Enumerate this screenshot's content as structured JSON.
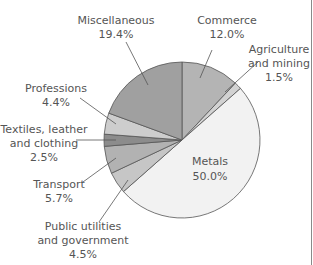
{
  "chart_data": {
    "type": "pie",
    "title": "",
    "start_angle_deg": 0,
    "direction": "clockwise",
    "slices": [
      {
        "label": "Commerce",
        "value": 12.0,
        "display": "12.0%",
        "color": "#b4b4b4"
      },
      {
        "label": "Agriculture and mining",
        "value": 1.5,
        "display": "1.5%",
        "color": "#d2d2d2"
      },
      {
        "label": "Metals",
        "value": 50.0,
        "display": "50.0%",
        "color": "#f2f2f2"
      },
      {
        "label": "Public utilities and government",
        "value": 4.5,
        "display": "4.5%",
        "color": "#c6c6c6"
      },
      {
        "label": "Transport",
        "value": 5.7,
        "display": "5.7%",
        "color": "#b2b2b2"
      },
      {
        "label": "Textiles, leather and clothing",
        "value": 2.5,
        "display": "2.5%",
        "color": "#8c8c8c"
      },
      {
        "label": "Professions",
        "value": 4.4,
        "display": "4.4%",
        "color": "#cdcdcd"
      },
      {
        "label": "Miscellaneous",
        "value": 19.4,
        "display": "19.4%",
        "color": "#a0a0a0"
      }
    ]
  },
  "labels": {
    "miscellaneous": {
      "line1": "Miscellaneous",
      "line2": "19.4%"
    },
    "commerce": {
      "line1": "Commerce",
      "line2": "12.0%"
    },
    "agriculture": {
      "line1": "Agriculture",
      "line2": "and mining",
      "line3": "1.5%"
    },
    "professions": {
      "line1": "Professions",
      "line2": "4.4%"
    },
    "textiles": {
      "line1": "Textiles, leather",
      "line2": "and clothing",
      "line3": "2.5%"
    },
    "transport": {
      "line1": "Transport",
      "line2": "5.7%"
    },
    "public": {
      "line1": "Public utilities",
      "line2": "and government",
      "line3": "4.5%"
    },
    "metals": {
      "line1": "Metals",
      "line2": "50.0%"
    }
  }
}
